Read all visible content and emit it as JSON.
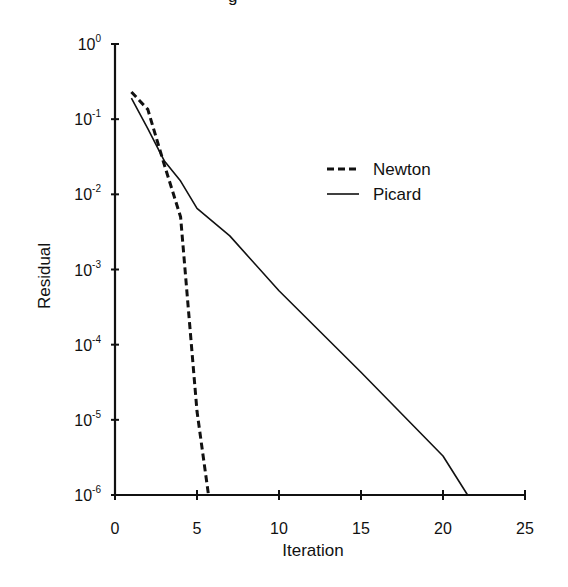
{
  "chart_data": {
    "type": "line",
    "title": "",
    "title_fragment_visible": "g",
    "xlabel": "Iteration",
    "ylabel": "Residual",
    "xlim": [
      0,
      25
    ],
    "ylim": [
      1e-06,
      1
    ],
    "yscale": "log",
    "grid": false,
    "x_ticks": [
      0,
      5,
      10,
      15,
      20,
      25
    ],
    "x_tick_labels": [
      "0",
      "5",
      "10",
      "15",
      "20",
      "25"
    ],
    "y_ticks": [
      1,
      0.1,
      0.01,
      0.001,
      0.0001,
      1e-05,
      1e-06
    ],
    "y_tick_labels": [
      {
        "base": "10",
        "exp": "0"
      },
      {
        "base": "10",
        "exp": "-1"
      },
      {
        "base": "10",
        "exp": "-2"
      },
      {
        "base": "10",
        "exp": "-3"
      },
      {
        "base": "10",
        "exp": "-4"
      },
      {
        "base": "10",
        "exp": "-5"
      },
      {
        "base": "10",
        "exp": "-6"
      }
    ],
    "legend_position": "upper right (inside plot)",
    "series": [
      {
        "name": "Newton",
        "style": "dashed",
        "x": [
          1,
          2,
          3,
          4,
          5,
          5.7
        ],
        "y": [
          0.23,
          0.135,
          0.025,
          0.005,
          1.3e-05,
          1e-06
        ]
      },
      {
        "name": "Picard",
        "style": "solid",
        "x": [
          1,
          2,
          3,
          4,
          5,
          7,
          10,
          15,
          20,
          21.5
        ],
        "y": [
          0.19,
          0.075,
          0.028,
          0.015,
          0.0065,
          0.0028,
          0.00052,
          4.3e-05,
          3.3e-06,
          1e-06
        ]
      }
    ]
  },
  "legend": {
    "items": [
      {
        "label": "Newton",
        "style": "dashed"
      },
      {
        "label": "Picard",
        "style": "solid"
      }
    ]
  },
  "axes": {
    "xlabel": "Iteration",
    "ylabel": "Residual"
  },
  "colors": {
    "line": "#111111",
    "background": "#ffffff"
  }
}
